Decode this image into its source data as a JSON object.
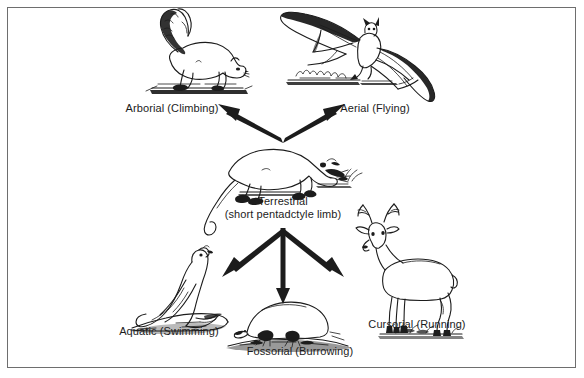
{
  "figure": {
    "background_color": "#ffffff",
    "ink_color": "#1c1c1c",
    "frame_color": "#6e6e6e"
  },
  "center_node": {
    "id": "terrestrial",
    "label_line1": "Terrestrial",
    "label_line2": "(short pentadctyle limb)",
    "animal": "shrew"
  },
  "nodes": [
    {
      "id": "arborial",
      "label": "Arborial (Climbing)",
      "animal": "squirrel",
      "direction": "upper-left"
    },
    {
      "id": "aerial",
      "label": "Aerial (Flying)",
      "animal": "bat",
      "direction": "upper-right"
    },
    {
      "id": "aquatic",
      "label": "Aquatic (Swimming)",
      "animal": "sea-lion",
      "direction": "lower-left"
    },
    {
      "id": "fossorial",
      "label": "Fossorial (Burrowing)",
      "animal": "mole",
      "direction": "down"
    },
    {
      "id": "cursorial",
      "label": "Cursorial (Running)",
      "animal": "deer",
      "direction": "lower-right"
    }
  ],
  "arrows": [
    {
      "id": "arrow-to-arborial",
      "from": "terrestrial",
      "to": "arborial"
    },
    {
      "id": "arrow-to-aerial",
      "from": "terrestrial",
      "to": "aerial"
    },
    {
      "id": "arrow-to-aquatic",
      "from": "terrestrial",
      "to": "aquatic"
    },
    {
      "id": "arrow-to-fossorial",
      "from": "terrestrial",
      "to": "fossorial"
    },
    {
      "id": "arrow-to-cursorial",
      "from": "terrestrial",
      "to": "cursorial"
    }
  ]
}
